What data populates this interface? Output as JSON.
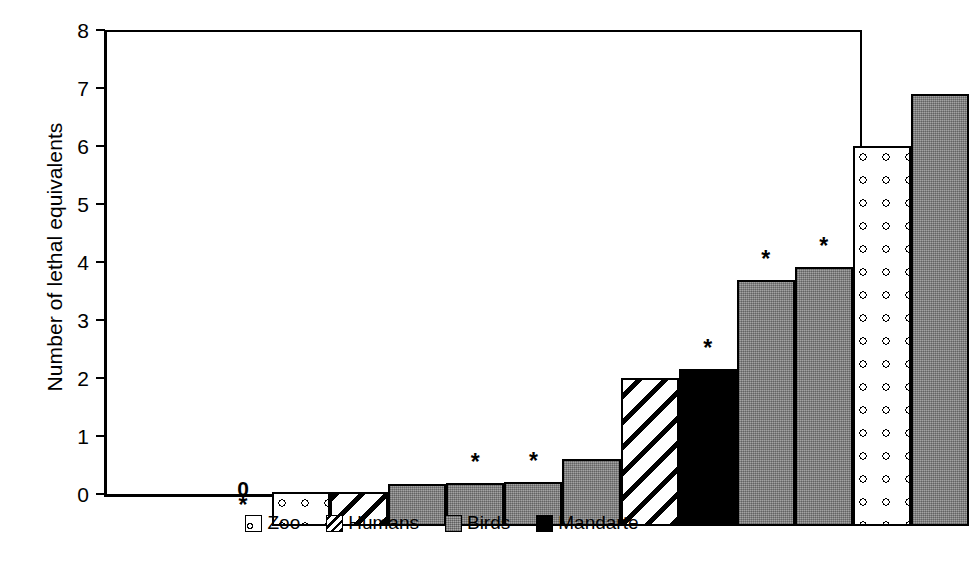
{
  "chart_data": {
    "type": "bar",
    "title": "",
    "xlabel": "",
    "ylabel": "Number of lethal equivalents",
    "ylim": [
      0,
      8
    ],
    "yticks": [
      0,
      1,
      2,
      3,
      4,
      5,
      6,
      7,
      8
    ],
    "ytick_labels": [
      "0",
      "1",
      "2",
      "3",
      "4",
      "5",
      "6",
      "7",
      "8"
    ],
    "grid": false,
    "legend_position": "bottom",
    "xtick_labels": [],
    "series_note": "Single series of 13 population estimates, each bar coloured by its source group.",
    "categories": [
      "Zoo",
      "Humans",
      "Birds",
      "Mandarte"
    ],
    "bars": [
      {
        "index": 1,
        "value": 0.0,
        "group": "Zoo",
        "annotation": "*",
        "value_label": "0"
      },
      {
        "index": 2,
        "value": 0.58,
        "group": "Zoo",
        "annotation": "",
        "value_label": ""
      },
      {
        "index": 3,
        "value": 0.58,
        "group": "Humans",
        "annotation": "",
        "value_label": ""
      },
      {
        "index": 4,
        "value": 0.72,
        "group": "Birds",
        "annotation": "",
        "value_label": ""
      },
      {
        "index": 5,
        "value": 0.75,
        "group": "Birds",
        "annotation": "*",
        "value_label": ""
      },
      {
        "index": 6,
        "value": 0.76,
        "group": "Birds",
        "annotation": "*",
        "value_label": ""
      },
      {
        "index": 7,
        "value": 1.15,
        "group": "Birds",
        "annotation": "",
        "value_label": ""
      },
      {
        "index": 8,
        "value": 2.55,
        "group": "Humans",
        "annotation": "",
        "value_label": ""
      },
      {
        "index": 9,
        "value": 2.7,
        "group": "Mandarte",
        "annotation": "*",
        "value_label": ""
      },
      {
        "index": 10,
        "value": 4.25,
        "group": "Birds",
        "annotation": "*",
        "value_label": ""
      },
      {
        "index": 11,
        "value": 4.47,
        "group": "Birds",
        "annotation": "*",
        "value_label": ""
      },
      {
        "index": 12,
        "value": 6.55,
        "group": "Zoo",
        "annotation": "",
        "value_label": ""
      },
      {
        "index": 13,
        "value": 7.45,
        "group": "Birds",
        "annotation": "",
        "value_label": ""
      }
    ]
  },
  "legend": {
    "items": [
      {
        "label": "Zoo",
        "swatch": "white-with-circles-swatch"
      },
      {
        "label": "Humans",
        "swatch": "diagonal-hatch-swatch"
      },
      {
        "label": "Birds",
        "swatch": "gray-fill-swatch"
      },
      {
        "label": "Mandarte",
        "swatch": "black-fill-swatch"
      }
    ]
  },
  "colors": {
    "axis": "#000000",
    "birds_fill": "#8d8d8d",
    "mandarte_fill": "#000000",
    "zoo_fill": "#ffffff",
    "humans_fill": "#ffffff",
    "background": "#ffffff"
  }
}
